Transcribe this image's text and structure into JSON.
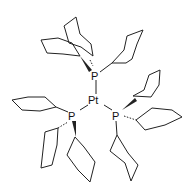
{
  "diagram": {
    "type": "chemical-structure",
    "compound": "Pt(PCy3)3",
    "atoms": {
      "center": "Pt",
      "ligand_top": "P",
      "ligand_left": "P",
      "ligand_right": "P"
    },
    "colors": {
      "bond": "#222222",
      "label": "#111111",
      "background": "#ffffff"
    }
  }
}
